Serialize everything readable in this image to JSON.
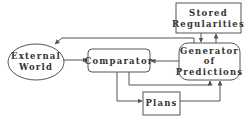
{
  "diagram": {
    "nodes": {
      "stored_regularities": {
        "line1": "Stored",
        "line2": "Regularities"
      },
      "generator": {
        "line1": "Generator",
        "line2": "of",
        "line3": "Predictions"
      },
      "external_world": {
        "line1": "External",
        "line2": "World"
      },
      "comparator": {
        "label": "Comparator"
      },
      "plans": {
        "label": "Plans"
      }
    },
    "edges": [
      {
        "from": "generator",
        "to": "stored_regularities"
      },
      {
        "from": "stored_regularities",
        "to": "generator"
      },
      {
        "from": "generator",
        "to": "external_world"
      },
      {
        "from": "external_world",
        "to": "comparator"
      },
      {
        "from": "generator",
        "to": "comparator"
      },
      {
        "from": "comparator",
        "to": "generator"
      },
      {
        "from": "comparator",
        "to": "plans"
      },
      {
        "from": "plans",
        "to": "generator"
      }
    ],
    "colors": {
      "stroke": "#555555",
      "text": "#333333",
      "background": "#ffffff"
    }
  }
}
